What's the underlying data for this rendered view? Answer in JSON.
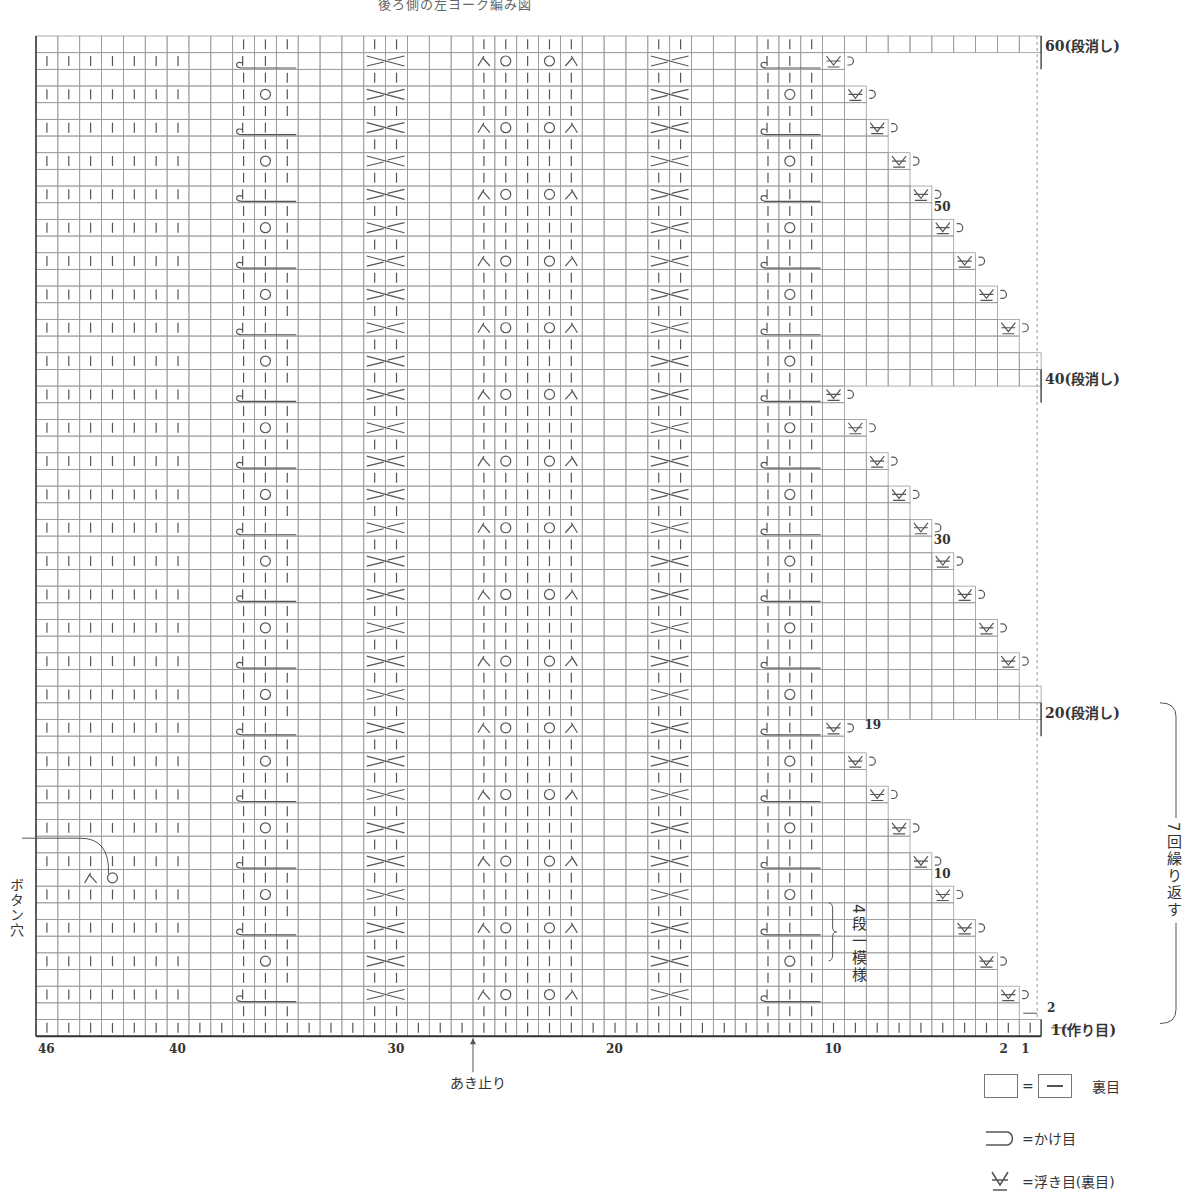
{
  "heading": "後ろ側の左ヨーク編み図",
  "grid": {
    "columns": 46,
    "rows": 60,
    "left": 36,
    "top": 36,
    "cell_w": 21.85,
    "cell_h": 16.67,
    "line_color": "#9a9a9a",
    "stroke_color": "#555555",
    "repeat_rows": 20,
    "repeat_top_rows": [
      20,
      40,
      60
    ]
  },
  "row_labels": [
    {
      "row": 60,
      "text": "60(段消し)"
    },
    {
      "row": 40,
      "text": "40(段消し)"
    },
    {
      "row": 20,
      "text": "20(段消し)"
    },
    {
      "row": 50,
      "text": "50"
    },
    {
      "row": 30,
      "text": "30"
    },
    {
      "row": 19,
      "text": "19"
    },
    {
      "row": 10,
      "text": "10"
    },
    {
      "row": 2,
      "text": "2"
    },
    {
      "row": 1,
      "text": "1(作り目)"
    }
  ],
  "column_labels": [
    {
      "col": 46,
      "text": "46"
    },
    {
      "col": 40,
      "text": "40"
    },
    {
      "col": 30,
      "text": "30"
    },
    {
      "col": 20,
      "text": "20"
    },
    {
      "col": 10,
      "text": "10"
    },
    {
      "col": 2,
      "text": "2"
    },
    {
      "col": 1,
      "text": "1"
    }
  ],
  "annotations": {
    "button_hole": "ボタン穴",
    "opening_end": "あき止り",
    "four_row_pattern": "4段一模様",
    "repeat_7": "7回繰り返す"
  },
  "legend": [
    {
      "symbol": "blank-box",
      "equals": "—",
      "label": "裏目"
    },
    {
      "symbol": "yarn-over",
      "label": "=かけ目"
    },
    {
      "symbol": "slip-stitch",
      "label": "=浮き目(裏目)"
    }
  ],
  "stitch_sections": {
    "ribbing_left": {
      "cols": [
        46,
        40
      ]
    },
    "cable_a": {
      "cols": [
        37,
        35
      ]
    },
    "cross_a": {
      "cols": [
        31,
        30
      ]
    },
    "lace": {
      "cols": [
        26,
        22
      ]
    },
    "cross_b": {
      "cols": [
        18,
        17
      ]
    },
    "cable_b": {
      "cols": [
        13,
        11
      ]
    }
  },
  "button_hole_row": 10,
  "short_row_step": {
    "slip_start_col": 10,
    "rows_per_step": 2,
    "cols_per_step": 1
  }
}
